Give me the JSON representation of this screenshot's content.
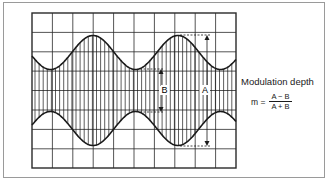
{
  "diagram": {
    "title": "Modulation depth",
    "formula": {
      "lhs": "m =",
      "numerator": "A − B",
      "denominator": "A + B"
    },
    "labels": {
      "B": "B",
      "A": "A"
    },
    "grid": {
      "columns": 10,
      "rows": 8
    },
    "colors": {
      "line": "#1a1a1a",
      "grid": "#2a2a2a",
      "frame": "#9a9a9a",
      "background": "#ffffff"
    }
  }
}
